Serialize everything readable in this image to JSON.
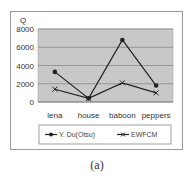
{
  "chart_data": {
    "type": "line",
    "title": "",
    "xlabel": "",
    "ylabel": "Q",
    "categories": [
      "lena",
      "house",
      "baboon",
      "peppers"
    ],
    "series": [
      {
        "name": "Y. Du(Otsu)",
        "marker": "circle",
        "values": [
          3300,
          400,
          6800,
          1800
        ]
      },
      {
        "name": "EWFCM",
        "marker": "x",
        "values": [
          1400,
          400,
          2100,
          1000
        ]
      }
    ],
    "ylim": [
      0,
      8000
    ],
    "yticks": [
      0,
      2000,
      4000,
      6000,
      8000
    ],
    "grid": true,
    "legend_position": "bottom"
  },
  "caption": "(a)",
  "colors": {
    "plot_bg": "#c8c8c8",
    "grid": "#8a8a8a",
    "line": "#222222"
  }
}
